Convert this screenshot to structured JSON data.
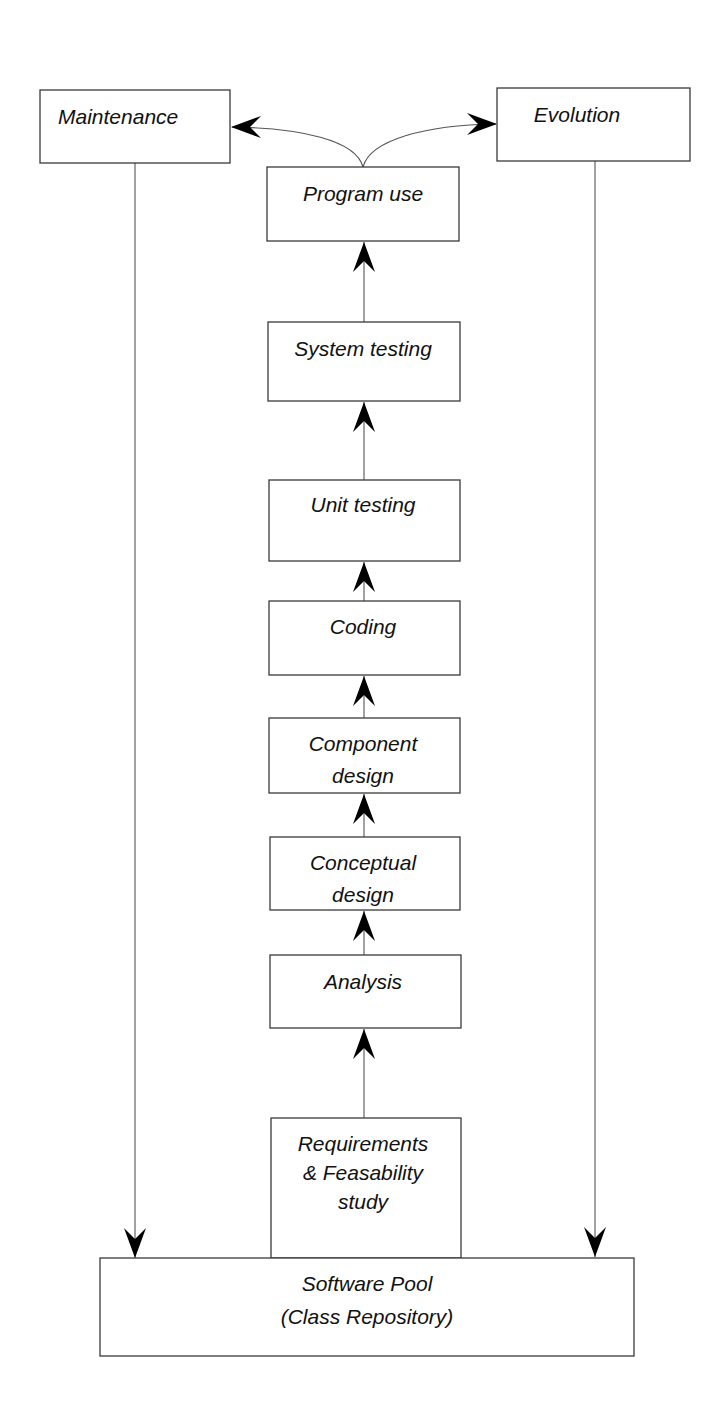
{
  "diagram": {
    "type": "flow",
    "title": "",
    "nodes": [
      {
        "id": "maintenance",
        "lines": [
          "Maintenance"
        ],
        "x": 40,
        "y": 90,
        "w": 190,
        "h": 73,
        "text_align": "start",
        "text_x": 58,
        "text_y": 118
      },
      {
        "id": "evolution",
        "lines": [
          "Evolution"
        ],
        "x": 497,
        "y": 88,
        "w": 193,
        "h": 73,
        "text_align": "middle",
        "text_x": 577,
        "text_y": 116
      },
      {
        "id": "program-use",
        "lines": [
          "Program use"
        ],
        "x": 267,
        "y": 167,
        "w": 192,
        "h": 74,
        "text_align": "middle",
        "text_x": 363,
        "text_y": 195
      },
      {
        "id": "system-testing",
        "lines": [
          "System testing"
        ],
        "x": 268,
        "y": 322,
        "w": 192,
        "h": 79,
        "text_align": "middle",
        "text_x": 363,
        "text_y": 350
      },
      {
        "id": "unit-testing",
        "lines": [
          "Unit testing"
        ],
        "x": 269,
        "y": 480,
        "w": 191,
        "h": 81,
        "text_align": "middle",
        "text_x": 363,
        "text_y": 506
      },
      {
        "id": "coding",
        "lines": [
          "Coding"
        ],
        "x": 269,
        "y": 601,
        "w": 191,
        "h": 74,
        "text_align": "middle",
        "text_x": 363,
        "text_y": 628
      },
      {
        "id": "component-design",
        "lines": [
          "Component",
          "design"
        ],
        "x": 269,
        "y": 718,
        "w": 191,
        "h": 75,
        "text_align": "middle",
        "text_x": 363,
        "text_y": 745,
        "line_gap": 32
      },
      {
        "id": "conceptual-design",
        "lines": [
          "Conceptual",
          "design"
        ],
        "x": 270,
        "y": 837,
        "w": 190,
        "h": 73,
        "text_align": "middle",
        "text_x": 363,
        "text_y": 864,
        "line_gap": 32
      },
      {
        "id": "analysis",
        "lines": [
          "Analysis"
        ],
        "x": 270,
        "y": 955,
        "w": 191,
        "h": 73,
        "text_align": "middle",
        "text_x": 363,
        "text_y": 983
      },
      {
        "id": "requirements",
        "lines": [
          "Requirements",
          "& Feasability",
          "study"
        ],
        "x": 271,
        "y": 1118,
        "w": 190,
        "h": 140,
        "text_align": "middle",
        "text_x": 363,
        "text_y": 1145,
        "line_gap": 29
      },
      {
        "id": "software-pool",
        "lines": [
          "Software Pool",
          "(Class Repository)"
        ],
        "x": 100,
        "y": 1258,
        "w": 534,
        "h": 98,
        "text_align": "middle",
        "text_x": 367,
        "text_y": 1285,
        "line_gap": 33
      }
    ],
    "edges": [
      {
        "from": "requirements",
        "to": "analysis",
        "kind": "straight",
        "x": 364,
        "y1": 1118,
        "y2": 1029,
        "dir": "up"
      },
      {
        "from": "analysis",
        "to": "conceptual-design",
        "kind": "straight",
        "x": 364,
        "y1": 955,
        "y2": 911,
        "dir": "up"
      },
      {
        "from": "conceptual-design",
        "to": "component-design",
        "kind": "straight",
        "x": 364,
        "y1": 837,
        "y2": 794,
        "dir": "up"
      },
      {
        "from": "component-design",
        "to": "coding",
        "kind": "straight",
        "x": 364,
        "y1": 718,
        "y2": 676,
        "dir": "up"
      },
      {
        "from": "coding",
        "to": "unit-testing",
        "kind": "straight",
        "x": 364,
        "y1": 601,
        "y2": 562,
        "dir": "up"
      },
      {
        "from": "unit-testing",
        "to": "system-testing",
        "kind": "straight",
        "x": 364,
        "y1": 480,
        "y2": 402,
        "dir": "up"
      },
      {
        "from": "system-testing",
        "to": "program-use",
        "kind": "straight",
        "x": 364,
        "y1": 322,
        "y2": 242,
        "dir": "up"
      },
      {
        "from": "program-use",
        "to": "maintenance",
        "kind": "curve",
        "path": "M363,167 C356,140 300,128 232,127",
        "tip_x": 231,
        "tip_y": 127,
        "dir": "left"
      },
      {
        "from": "program-use",
        "to": "evolution",
        "kind": "curve",
        "path": "M363,167 C370,140 425,125 496,124",
        "tip_x": 497,
        "tip_y": 124,
        "dir": "right"
      },
      {
        "from": "maintenance",
        "to": "software-pool",
        "kind": "straight",
        "x": 135,
        "y1": 163,
        "y2": 1258,
        "dir": "down"
      },
      {
        "from": "evolution",
        "to": "software-pool",
        "kind": "straight",
        "x": 595,
        "y1": 161,
        "y2": 1257,
        "dir": "down"
      }
    ]
  }
}
